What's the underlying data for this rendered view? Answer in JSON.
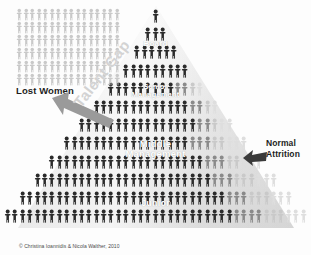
{
  "diagram": {
    "credit": "© Christina Ioannidis & Nicola Walther, 2010",
    "colors": {
      "figure_dark": "#2b2b2b",
      "figure_mid": "#8a8a8a",
      "figure_light": "#c9c9c9",
      "figure_faint": "#dedede",
      "pyramid_fill": "#eeeeee",
      "label_white": "#ffffff",
      "label_dark": "#1d1d1d",
      "watermark_gray": "#d3d3d3",
      "arrow_gray": "#9a9a9a"
    }
  },
  "tier_labels": [
    {
      "id": "board",
      "text": "Board"
    },
    {
      "id": "senior-management",
      "line1": "Senior",
      "line2": "Management"
    },
    {
      "id": "middle-management",
      "line1": "Middle",
      "line2": "Management"
    },
    {
      "id": "junior",
      "text": "Junior"
    }
  ],
  "annotations": {
    "lost_women": "Lost Women",
    "talent_gap": "Talent Gap",
    "normal_attrition_line1": "Normal",
    "normal_attrition_line2": "Attrition"
  },
  "chart_data": {
    "type": "pictogram-pyramid",
    "unit": "1 icon = 1 person",
    "legend": [
      "Lost Women",
      "Talent Gap",
      "Normal Attrition"
    ],
    "tiers": [
      {
        "level": "Board",
        "row": 1,
        "total": 1,
        "dark": 1,
        "light": 0
      },
      {
        "level": "Board",
        "row": 2,
        "total": 3,
        "dark": 3,
        "light": 0
      },
      {
        "level": "Board",
        "row": 3,
        "total": 6,
        "dark": 6,
        "light": 0
      },
      {
        "level": "Senior Management",
        "row": 4,
        "total": 9,
        "dark": 9,
        "light": 0
      },
      {
        "level": "Senior Management",
        "row": 5,
        "total": 13,
        "dark": 9,
        "light": 4
      },
      {
        "level": "Senior Management",
        "row": 6,
        "total": 17,
        "dark": 13,
        "light": 4
      },
      {
        "level": "Middle Management",
        "row": 7,
        "total": 21,
        "dark": 16,
        "light": 5
      },
      {
        "level": "Middle Management",
        "row": 8,
        "total": 25,
        "dark": 17,
        "light": 8
      },
      {
        "level": "Middle Management",
        "row": 9,
        "total": 29,
        "dark": 21,
        "light": 8
      },
      {
        "level": "Junior",
        "row": 10,
        "total": 33,
        "dark": 24,
        "light": 9
      },
      {
        "level": "Junior",
        "row": 11,
        "total": 37,
        "dark": 28,
        "light": 9
      },
      {
        "level": "Junior",
        "row": 12,
        "total": 41,
        "dark": 31,
        "light": 10
      }
    ],
    "lost_women_block": {
      "rows": 6,
      "per_row": 16,
      "total": 96
    }
  }
}
